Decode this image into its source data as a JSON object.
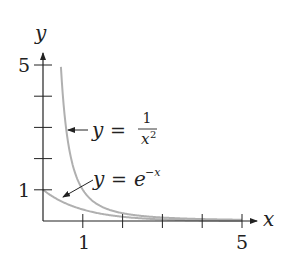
{
  "chart_data": {
    "type": "line",
    "title": "",
    "xlabel": "x",
    "ylabel": "y",
    "xlim": [
      0,
      5.2
    ],
    "ylim": [
      0,
      5.2
    ],
    "x_ticks": [
      1,
      2,
      3,
      4,
      5
    ],
    "x_tick_labels": [
      "1",
      "",
      "",
      "",
      "5"
    ],
    "y_ticks": [
      1,
      2,
      3,
      4,
      5
    ],
    "y_tick_labels": [
      "1",
      "",
      "",
      "",
      "5"
    ],
    "grid": false,
    "legend": "none (inline arrow annotations)",
    "series": [
      {
        "name": "y = 1/x^2",
        "formula": "1/x^2",
        "x_range": [
          0.45,
          5.0
        ],
        "color": "#b0b0b0",
        "sample_points": [
          [
            0.45,
            4.94
          ],
          [
            0.5,
            4.0
          ],
          [
            0.75,
            1.78
          ],
          [
            1,
            1.0
          ],
          [
            1.5,
            0.44
          ],
          [
            2,
            0.25
          ],
          [
            3,
            0.11
          ],
          [
            4,
            0.06
          ],
          [
            5,
            0.04
          ]
        ]
      },
      {
        "name": "y = e^(-x)",
        "formula": "exp(-x)",
        "x_range": [
          0.0,
          5.0
        ],
        "color": "#b0b0b0",
        "sample_points": [
          [
            0,
            1.0
          ],
          [
            0.5,
            0.61
          ],
          [
            1,
            0.37
          ],
          [
            2,
            0.14
          ],
          [
            3,
            0.05
          ],
          [
            4,
            0.02
          ],
          [
            5,
            0.007
          ]
        ]
      }
    ],
    "annotations": [
      {
        "text": "y = 1/x²",
        "arrow_to": [
          0.55,
          3.0
        ]
      },
      {
        "text": "y = e^(−x)",
        "arrow_to": [
          0.55,
          0.58
        ]
      }
    ]
  },
  "labels": {
    "x_axis": "x",
    "y_axis": "y",
    "tick_x1": "1",
    "tick_x5": "5",
    "tick_y1": "1",
    "tick_y5": "5",
    "ann1_lhs": "y",
    "ann1_eq": "=",
    "ann1_num": "1",
    "ann1_den": "x",
    "ann1_exp": "2",
    "ann2_lhs": "y",
    "ann2_eq": "=",
    "ann2_base": "e",
    "ann2_exp": "−x"
  },
  "colors": {
    "axis": "#222222",
    "curve": "#b0b0b0"
  }
}
